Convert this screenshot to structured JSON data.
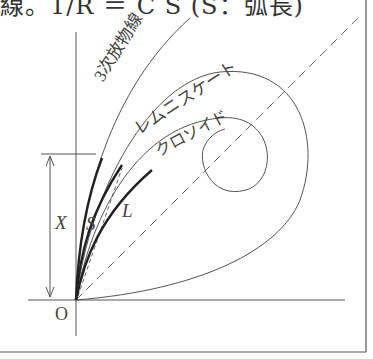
{
  "title": "線。1/R ＝ C S (S：弧長)",
  "labels": {
    "cubic_parabola": "3次放物線",
    "lemniscate": "レムニスケート",
    "clothoid": "クロソイド",
    "x": "X",
    "s": "S",
    "l": "L",
    "origin": "O"
  },
  "colors": {
    "line": "#555555",
    "bold": "#222222"
  }
}
